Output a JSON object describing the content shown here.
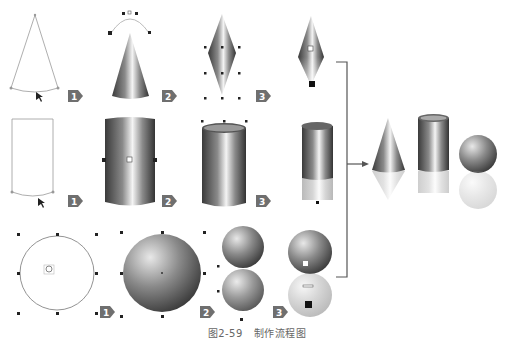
{
  "figure": {
    "caption_number": "图2-59",
    "caption_title": "制作流程图"
  },
  "rows": [
    {
      "name": "cone",
      "steps": [
        "1",
        "2",
        "3"
      ]
    },
    {
      "name": "cylinder",
      "steps": [
        "1",
        "2",
        "3"
      ]
    },
    {
      "name": "sphere",
      "steps": [
        "1",
        "2",
        "3"
      ]
    }
  ],
  "result": {
    "shapes": [
      "cone",
      "cylinder",
      "sphere"
    ]
  },
  "colors": {
    "badge": "#6f6f6f",
    "bracket": "#555555",
    "outline": "#999999"
  }
}
